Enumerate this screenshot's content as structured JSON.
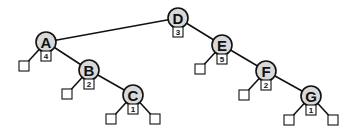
{
  "diagram": {
    "type": "binary-tree",
    "root": "D",
    "nodes": [
      {
        "id": "D",
        "label": "D",
        "badge": "3",
        "parent": null,
        "side": null
      },
      {
        "id": "A",
        "label": "A",
        "badge": "4",
        "parent": "D",
        "side": "left"
      },
      {
        "id": "B",
        "label": "B",
        "badge": "2",
        "parent": "A",
        "side": "right"
      },
      {
        "id": "C",
        "label": "C",
        "badge": "1",
        "parent": "B",
        "side": "right"
      },
      {
        "id": "E",
        "label": "E",
        "badge": "5",
        "parent": "D",
        "side": "right"
      },
      {
        "id": "F",
        "label": "F",
        "badge": "2",
        "parent": "E",
        "side": "right"
      },
      {
        "id": "G",
        "label": "G",
        "badge": "1",
        "parent": "F",
        "side": "right"
      }
    ],
    "leaves": [
      {
        "parent": "A",
        "side": "left"
      },
      {
        "parent": "B",
        "side": "left"
      },
      {
        "parent": "C",
        "side": "left"
      },
      {
        "parent": "C",
        "side": "right"
      },
      {
        "parent": "E",
        "side": "left"
      },
      {
        "parent": "F",
        "side": "left"
      },
      {
        "parent": "G",
        "side": "left"
      },
      {
        "parent": "G",
        "side": "right"
      }
    ]
  }
}
